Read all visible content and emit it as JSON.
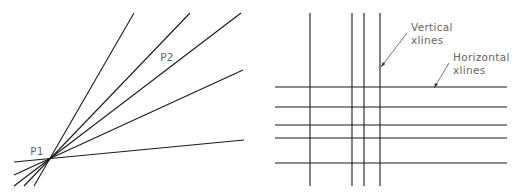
{
  "figure_left": {
    "title": "Xlines through a point",
    "point_labels": [
      {
        "id": "p1",
        "text": "P1",
        "x": 37,
        "y": 155
      },
      {
        "id": "p2",
        "text": "P2",
        "x": 167,
        "y": 61
      }
    ],
    "origin": {
      "x": 49,
      "y": 158
    },
    "lines": [
      {
        "x1": 34,
        "y1": 186,
        "x2": 134,
        "y2": 13
      },
      {
        "x1": 24,
        "y1": 186,
        "x2": 190,
        "y2": 13
      },
      {
        "x1": 14,
        "y1": 186,
        "x2": 241,
        "y2": 13
      },
      {
        "x1": 14,
        "y1": 175,
        "x2": 243,
        "y2": 70
      },
      {
        "x1": 14,
        "y1": 162,
        "x2": 244,
        "y2": 140
      }
    ]
  },
  "figure_right": {
    "title": "Vertical and horizontal xlines",
    "vertical_lines_x": [
      310,
      352,
      364,
      380
    ],
    "vertical_range": [
      13,
      186
    ],
    "horizontal_lines_y": [
      87,
      107,
      125,
      138,
      163
    ],
    "horizontal_range": [
      275,
      507
    ],
    "callouts": [
      {
        "id": "vertical",
        "line1": "Vertical",
        "line2": "xlines",
        "x": 411,
        "y": 31,
        "leader": {
          "x1": 407,
          "y1": 33,
          "x2": 381,
          "y2": 67
        }
      },
      {
        "id": "horizontal",
        "line1": "Horizontal",
        "line2": "xlines",
        "x": 453,
        "y": 61,
        "leader": {
          "x1": 449,
          "y1": 63,
          "x2": 434,
          "y2": 88
        }
      }
    ]
  },
  "colors": {
    "line": "#1a1a1a",
    "label": "#666666",
    "background": "#ffffff"
  }
}
